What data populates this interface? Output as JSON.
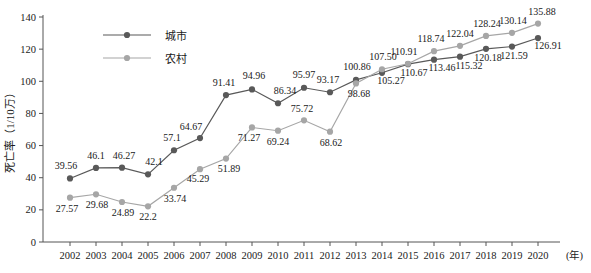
{
  "chart_data": {
    "type": "line",
    "title": "",
    "xlabel": "(年)",
    "ylabel": "死亡率（1/10万）",
    "xlim": [
      2002,
      2020
    ],
    "ylim": [
      0,
      140
    ],
    "ytick_step": 20,
    "grid": false,
    "legend_position": "top-left",
    "categories": [
      "2002",
      "2003",
      "2004",
      "2005",
      "2006",
      "2007",
      "2008",
      "2009",
      "2010",
      "2011",
      "2012",
      "2013",
      "2014",
      "2015",
      "2016",
      "2017",
      "2018",
      "2019",
      "2020"
    ],
    "yticks": [
      "0",
      "20",
      "40",
      "60",
      "80",
      "100",
      "120",
      "140"
    ],
    "series": [
      {
        "name": "城市",
        "color": "#595959",
        "values": [
          39.56,
          46.1,
          46.27,
          42.1,
          57.1,
          64.67,
          91.41,
          94.96,
          86.34,
          95.97,
          93.17,
          100.86,
          105.27,
          110.67,
          113.46,
          115.32,
          120.18,
          121.59,
          126.91
        ],
        "labels": [
          "39.56",
          "46.1",
          "46.27",
          "42.1",
          "57.1",
          "64.67",
          "91.41",
          "94.96",
          "86.34",
          "95.97",
          "93.17",
          "100.86",
          "105.27",
          "110.67",
          "113.46",
          "115.32",
          "120.18",
          "121.59",
          "126.91"
        ]
      },
      {
        "name": "农村",
        "color": "#a6a6a6",
        "values": [
          27.57,
          29.68,
          24.89,
          22.2,
          33.74,
          45.29,
          51.89,
          71.27,
          69.24,
          75.72,
          68.62,
          98.68,
          107.5,
          110.91,
          118.74,
          122.04,
          128.24,
          130.14,
          135.88
        ],
        "labels": [
          "27.57",
          "29.68",
          "24.89",
          "22.2",
          "33.74",
          "45.29",
          "51.89",
          "71.27",
          "69.24",
          "75.72",
          "68.62",
          "98.68",
          "107.50",
          "110.91",
          "118.74",
          "122.04",
          "128.24",
          "130.14",
          "135.88"
        ]
      }
    ]
  },
  "legend": {
    "items": [
      {
        "label": "城市"
      },
      {
        "label": "农村"
      }
    ]
  }
}
